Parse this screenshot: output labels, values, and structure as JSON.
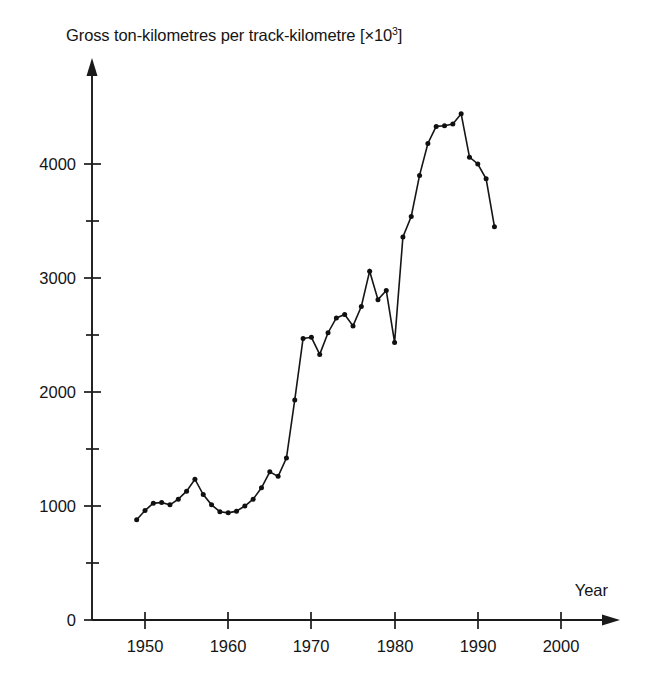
{
  "figure": {
    "background_color": "#ffffff",
    "ink_color": "#151515"
  },
  "chart_data": {
    "type": "line",
    "title_prefix": "Gross ton-kilometres per track-kilometre [×10",
    "title_exponent": "3",
    "title_suffix": "]",
    "xlabel": "Year",
    "ylabel": "",
    "xlim": [
      1944.5,
      2004.5
    ],
    "ylim": [
      0,
      4700
    ],
    "grid": false,
    "legend": null,
    "markers": "filled-circle",
    "x_major_ticks": [
      1950,
      1960,
      1970,
      1980,
      1990,
      2000
    ],
    "x_tick_labels": [
      "1950",
      "1960",
      "1970",
      "1980",
      "1990",
      "2000"
    ],
    "y_major_ticks": [
      0,
      1000,
      2000,
      3000,
      4000
    ],
    "y_tick_labels": [
      "0",
      "1000",
      "2000",
      "3000",
      "4000"
    ],
    "y_minor_ticks": [
      500,
      1500,
      2500,
      3500
    ],
    "series": [
      {
        "name": "Gross ton-kilometres per track-kilometre",
        "x": [
          1949,
          1950,
          1951,
          1952,
          1953,
          1954,
          1955,
          1956,
          1957,
          1958,
          1959,
          1960,
          1961,
          1962,
          1963,
          1964,
          1965,
          1966,
          1967,
          1968,
          1969,
          1970,
          1971,
          1972,
          1973,
          1974,
          1975,
          1976,
          1977,
          1978,
          1979,
          1980,
          1981,
          1982,
          1983,
          1984,
          1985,
          1986,
          1987,
          1988,
          1989,
          1990,
          1991,
          1992
        ],
        "values": [
          880,
          960,
          1025,
          1030,
          1010,
          1060,
          1130,
          1235,
          1100,
          1010,
          950,
          940,
          955,
          1000,
          1060,
          1160,
          1300,
          1260,
          1420,
          1930,
          2470,
          2480,
          2330,
          2520,
          2650,
          2680,
          2580,
          2750,
          3060,
          2810,
          2890,
          2435,
          3360,
          3540,
          3900,
          4180,
          4330,
          4335,
          4350,
          4440,
          4060,
          4000,
          3870,
          3450
        ]
      }
    ]
  }
}
